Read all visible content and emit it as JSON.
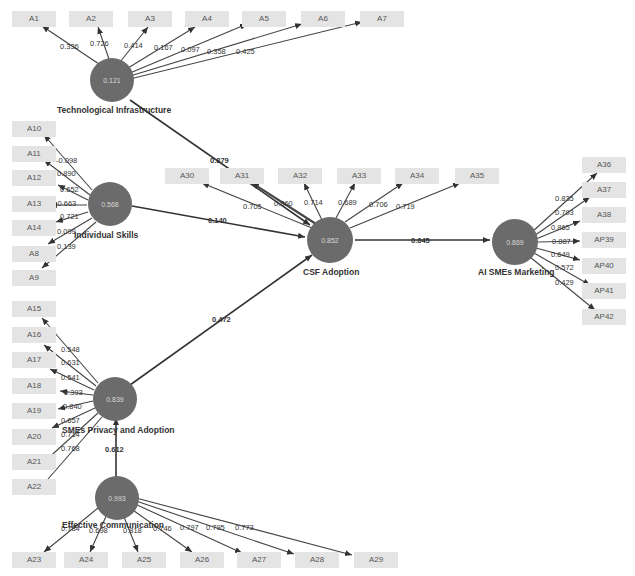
{
  "constructs": {
    "tech": {
      "name": "Technological Infrastructure",
      "r2": "0.121"
    },
    "skills": {
      "name": "Individual Skills",
      "r2": "0.568"
    },
    "privacy": {
      "name": "SMEs Privacy and Adoption",
      "r2": "0.839"
    },
    "comm": {
      "name": "Effective Communication",
      "r2": "0.993"
    },
    "csf": {
      "name": "CSF Adoption",
      "r2": "0.852"
    },
    "ai": {
      "name": "AI SMEs Marketing",
      "r2": "0.869"
    }
  },
  "indicators": {
    "tech": [
      {
        "label": "A1",
        "w": "0.336"
      },
      {
        "label": "A2",
        "w": "0.726"
      },
      {
        "label": "A3",
        "w": "0.414"
      },
      {
        "label": "A4",
        "w": "0.167"
      },
      {
        "label": "A5",
        "w": "0.097"
      },
      {
        "label": "A6",
        "w": "0.358"
      },
      {
        "label": "A7",
        "w": "0.425"
      }
    ],
    "skills": [
      {
        "label": "A10",
        "w": "-0.098"
      },
      {
        "label": "A11",
        "w": "0.890"
      },
      {
        "label": "A12",
        "w": "0.652"
      },
      {
        "label": "A13",
        "w": "-0.663"
      },
      {
        "label": "A14",
        "w": "0.721"
      },
      {
        "label": "A8",
        "w": "0.099"
      },
      {
        "label": "A9",
        "w": "0.139"
      }
    ],
    "privacy": [
      {
        "label": "A15",
        "w": "0.548"
      },
      {
        "label": "A16",
        "w": "0.631"
      },
      {
        "label": "A17",
        "w": "0.541"
      },
      {
        "label": "A18",
        "w": "0.393"
      },
      {
        "label": "A19",
        "w": "0.840"
      },
      {
        "label": "A20",
        "w": "0.657"
      },
      {
        "label": "A21",
        "w": "0.714"
      },
      {
        "label": "A22",
        "w": "0.768"
      }
    ],
    "comm": [
      {
        "label": "A23",
        "w": "0.784"
      },
      {
        "label": "A24",
        "w": "0.698"
      },
      {
        "label": "A25",
        "w": "0.818"
      },
      {
        "label": "A26",
        "w": "0.746"
      },
      {
        "label": "A27",
        "w": "0.797"
      },
      {
        "label": "A28",
        "w": "0.795"
      },
      {
        "label": "A29",
        "w": "0.773"
      }
    ],
    "csf": [
      {
        "label": "A30",
        "w": "0.705"
      },
      {
        "label": "A31",
        "w": "0.860"
      },
      {
        "label": "A32",
        "w": "0.714"
      },
      {
        "label": "A33",
        "w": "0.689"
      },
      {
        "label": "A34",
        "w": "0.706"
      },
      {
        "label": "A35",
        "w": "0.719"
      }
    ],
    "ai": [
      {
        "label": "A36",
        "w": "0.835"
      },
      {
        "label": "A37",
        "w": "0.793"
      },
      {
        "label": "A38",
        "w": "0.865"
      },
      {
        "label": "AP39",
        "w": "0.887"
      },
      {
        "label": "AP40",
        "w": "0.649"
      },
      {
        "label": "AP41",
        "w": "0.572"
      },
      {
        "label": "AP42",
        "w": "0.429"
      }
    ]
  },
  "paths": {
    "tech_csf": "0.879",
    "skills_csf": "0.140",
    "privacy_csf": "0.472",
    "comm_privacy": "0.612",
    "csf_ai": "0.645"
  },
  "colors": {
    "construct": "#6b6b6b",
    "indicator_bg": "#e4e4e4",
    "line": "#333333"
  }
}
